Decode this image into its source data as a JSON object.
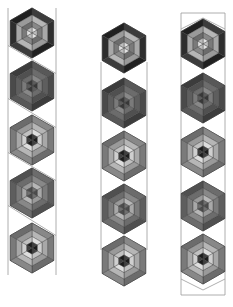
{
  "diagram": {
    "type": "hexagon quilt block strips",
    "canvas": {
      "width": 233,
      "height": 307,
      "background": "#ffffff"
    },
    "palette": {
      "outline": "#9a9a9a",
      "darkest": "#2e2e2e",
      "dark": "#4a4a4a",
      "mid_dark": "#5e5e5e",
      "mid": "#7a7a7a",
      "light": "#a8a8a8",
      "lightest": "#cfcfcf"
    },
    "columns": [
      {
        "id": "column-1",
        "style": "zigzag",
        "center_x": 32,
        "hex_radius": 25,
        "hex_centers_y": [
          33,
          86,
          140,
          193,
          248
        ],
        "border_left": 8,
        "border_right": 56,
        "top": 8,
        "bottom": 275,
        "variants": [
          "A",
          "B",
          "C",
          "D",
          "C"
        ]
      },
      {
        "id": "column-2",
        "style": "straight",
        "center_x": 124,
        "hex_radius": 25,
        "hex_centers_y": [
          48,
          103,
          156,
          209,
          261
        ],
        "border_left": 101,
        "border_right": 147,
        "top": 62,
        "bottom": 250,
        "variants": [
          "A",
          "B",
          "C",
          "D",
          "C"
        ]
      },
      {
        "id": "column-3",
        "style": "chevron-capped",
        "center_x": 203,
        "hex_radius": 25,
        "hex_centers_y": [
          44,
          98,
          152,
          206,
          259
        ],
        "border_left": 181,
        "border_right": 225,
        "top": 13,
        "bottom": 295,
        "variants": [
          "A",
          "B",
          "C",
          "D",
          "C"
        ]
      }
    ],
    "block_variants": {
      "A": {
        "outer": "darkest",
        "middle": "light",
        "inner": "mid",
        "core": "lightest"
      },
      "B": {
        "outer": "dark",
        "middle": "mid_dark",
        "inner": "mid",
        "core": "dark"
      },
      "C": {
        "outer": "mid",
        "middle": "light",
        "inner": "lightest",
        "core": "darkest"
      },
      "D": {
        "outer": "mid_dark",
        "middle": "mid",
        "inner": "light",
        "core": "mid_dark"
      }
    }
  }
}
